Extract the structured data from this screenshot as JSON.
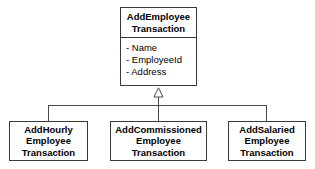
{
  "diagram": {
    "type": "uml-class-diagram",
    "relationship": "generalization",
    "background_color": "#ffffff",
    "line_color": "#4a4a4a",
    "border_color": "#3a3a3a",
    "text_color": "#000000"
  },
  "parent": {
    "name": "AddEmployeeTransaction",
    "title_lines": [
      "AddEmployee",
      "Transaction"
    ],
    "attributes": [
      "- Name",
      "- EmployeeId",
      "- Address"
    ]
  },
  "children": [
    {
      "name": "AddHourlyEmployeeTransaction",
      "title_lines": [
        "AddHourly",
        "Employee",
        "Transaction"
      ]
    },
    {
      "name": "AddCommissionedEmployeeTransaction",
      "title_lines": [
        "AddCommissioned",
        "Employee",
        "Transaction"
      ]
    },
    {
      "name": "AddSalariedEmployeeTransaction",
      "title_lines": [
        "AddSalaried",
        "Employee",
        "Transaction"
      ]
    }
  ]
}
